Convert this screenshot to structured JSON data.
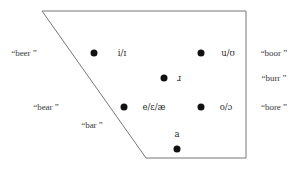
{
  "figure": {
    "name": "english-rhotic-vowel-quadrilateral",
    "background_color": "#ffffff",
    "outline_color": "#777777",
    "dot_color": "#111111",
    "text_color": "#3a3a3a"
  },
  "quadrilateral": {
    "points": "42,11 246,11 246,158 146,158",
    "vertices": [
      {
        "label": "top-left",
        "x": 42,
        "y": 11
      },
      {
        "label": "top-right",
        "x": 246,
        "y": 11
      },
      {
        "label": "bottom-right",
        "x": 246,
        "y": 158
      },
      {
        "label": "bottom-left",
        "x": 146,
        "y": 158
      }
    ]
  },
  "vowels": [
    {
      "id": "high-front",
      "ipa": "i/ɪ",
      "dot_x": 94,
      "dot_y": 53,
      "label_x": 122,
      "label_y": 53
    },
    {
      "id": "high-back",
      "ipa": "u/ʊ",
      "dot_x": 201,
      "dot_y": 53,
      "label_x": 228,
      "label_y": 53
    },
    {
      "id": "central-rhotic",
      "ipa": "ɹ",
      "dot_x": 164,
      "dot_y": 78,
      "label_x": 179,
      "label_y": 78
    },
    {
      "id": "mid-front",
      "ipa": "e/ɛ/æ",
      "dot_x": 124,
      "dot_y": 107,
      "label_x": 154,
      "label_y": 107
    },
    {
      "id": "mid-back",
      "ipa": "o/ɔ",
      "dot_x": 201,
      "dot_y": 107,
      "label_x": 226,
      "label_y": 107
    },
    {
      "id": "low-central",
      "ipa": "a",
      "dot_x": 177,
      "dot_y": 149,
      "label_x": 177,
      "label_y": 134
    }
  ],
  "keywords": [
    {
      "id": "beer",
      "text": "“beer ”",
      "x": 24,
      "y": 53
    },
    {
      "id": "boor",
      "text": "“boor ”",
      "x": 274,
      "y": 53
    },
    {
      "id": "burr",
      "text": "“burr ”",
      "x": 274,
      "y": 78
    },
    {
      "id": "bear",
      "text": "“bear ”",
      "x": 46,
      "y": 107
    },
    {
      "id": "bore",
      "text": "“bore ”",
      "x": 274,
      "y": 107
    },
    {
      "id": "bar",
      "text": "“bar ”",
      "x": 92,
      "y": 125
    }
  ]
}
